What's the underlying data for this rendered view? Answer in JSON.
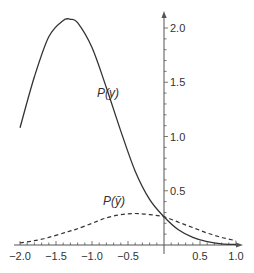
{
  "chart_data": {
    "type": "line",
    "title": "",
    "xlabel": "",
    "ylabel": "",
    "xlim": [
      -2.0,
      1.05
    ],
    "ylim": [
      0,
      2.2
    ],
    "grid": false,
    "legend_position": "inline labels",
    "x_ticks": [
      "−2.0",
      "−1.5",
      "−1.0",
      "−0.5",
      "0.5",
      "1.0"
    ],
    "x_tick_values": [
      -2.0,
      -1.5,
      -1.0,
      -0.5,
      0.5,
      1.0
    ],
    "y_ticks": [
      "0.5",
      "1.0",
      "1.5",
      "2.0"
    ],
    "y_tick_values": [
      0.5,
      1.0,
      1.5,
      2.0
    ],
    "x": [
      -2.0,
      -1.8,
      -1.6,
      -1.4,
      -1.3,
      -1.2,
      -1.0,
      -0.8,
      -0.6,
      -0.4,
      -0.2,
      0.0,
      0.2,
      0.4,
      0.6,
      0.8,
      1.0
    ],
    "series": [
      {
        "name": "P(y)",
        "style": "solid",
        "values": [
          1.08,
          1.55,
          1.92,
          2.07,
          2.08,
          2.05,
          1.82,
          1.45,
          1.05,
          0.68,
          0.42,
          0.26,
          0.14,
          0.07,
          0.03,
          0.01,
          0.005
        ]
      },
      {
        "name": "P(ȳ)",
        "style": "dashed",
        "values": [
          0.02,
          0.04,
          0.07,
          0.11,
          0.13,
          0.15,
          0.2,
          0.25,
          0.28,
          0.29,
          0.28,
          0.26,
          0.21,
          0.16,
          0.11,
          0.07,
          0.04
        ]
      }
    ],
    "annotations": [
      {
        "text": "P(y)",
        "x": -0.8,
        "y": 1.8
      },
      {
        "text": "P(ȳ)",
        "x": -0.55,
        "y": 0.38
      }
    ]
  },
  "labels": {
    "solid_series": "P(y)",
    "dashed_series": "P(ȳ)"
  }
}
